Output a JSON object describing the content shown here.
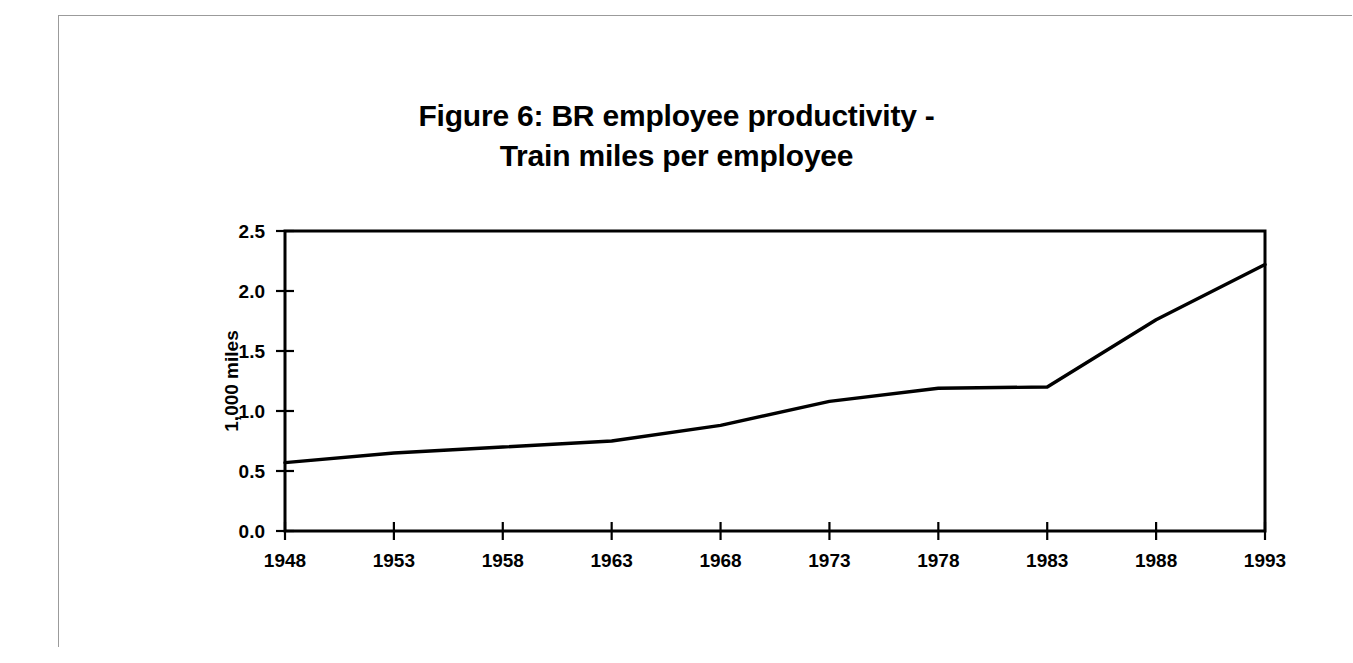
{
  "figure": {
    "title_line_1": "Figure 6: BR employee productivity -",
    "title_line_2": "Train miles per employee"
  },
  "axes": {
    "y_label": "1,000 miles",
    "y_ticks": [
      "0.0",
      "0.5",
      "1.0",
      "1.5",
      "2.0",
      "2.5"
    ],
    "x_ticks": [
      "1948",
      "1953",
      "1958",
      "1963",
      "1968",
      "1973",
      "1978",
      "1983",
      "1988",
      "1993"
    ]
  },
  "colors": {
    "line": "#000000",
    "axis": "#000000",
    "background": "#ffffff",
    "page_frame": "#9b9b9b"
  },
  "chart_data": {
    "type": "line",
    "title": "Figure 6: BR employee productivity - Train miles per employee",
    "xlabel": "",
    "ylabel": "1,000 miles",
    "x": [
      1948,
      1953,
      1958,
      1963,
      1968,
      1973,
      1978,
      1983,
      1988,
      1993
    ],
    "categories": [
      "1948",
      "1953",
      "1958",
      "1963",
      "1968",
      "1973",
      "1978",
      "1983",
      "1988",
      "1993"
    ],
    "series": [
      {
        "name": "Train miles per employee",
        "values": [
          0.57,
          0.65,
          0.7,
          0.75,
          0.88,
          1.08,
          1.19,
          1.2,
          1.76,
          2.22
        ]
      }
    ],
    "xlim": [
      1948,
      1993
    ],
    "ylim": [
      0.0,
      2.5
    ],
    "ytick_values": [
      0.0,
      0.5,
      1.0,
      1.5,
      2.0,
      2.5
    ],
    "xtick_values": [
      1948,
      1953,
      1958,
      1963,
      1968,
      1973,
      1978,
      1983,
      1988,
      1993
    ],
    "grid": false,
    "legend": false
  }
}
